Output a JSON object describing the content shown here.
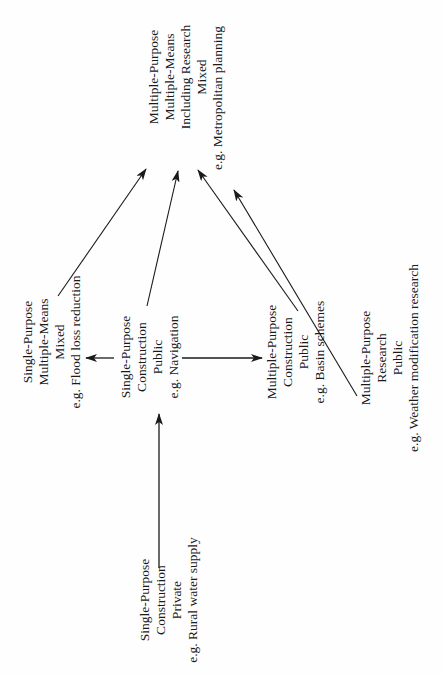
{
  "diagram": {
    "orientation": "rotated-90-ccw",
    "nodes": [
      {
        "id": "hub",
        "lines": [
          "Multiple-Purpose",
          "Multiple-Means",
          "Including Research",
          "Mixed",
          "e.g. Metropolitan planning"
        ]
      },
      {
        "id": "flood",
        "lines": [
          "Single-Purpose",
          "Multiple-Means",
          "Mixed",
          "e.g. Flood loss reduction"
        ]
      },
      {
        "id": "navigation",
        "lines": [
          "Single-Purpose",
          "Construction",
          "Public",
          "e.g. Navigation"
        ]
      },
      {
        "id": "basin",
        "lines": [
          "Multiple-Purpose",
          "Construction",
          "Public",
          "e.g. Basin schemes"
        ]
      },
      {
        "id": "weather",
        "lines": [
          "Multiple-Purpose",
          "Research",
          "Public",
          "e.g. Weather modification research"
        ]
      },
      {
        "id": "rural",
        "lines": [
          "Single-Purpose",
          "Construction",
          "Private",
          "e.g. Rural water supply"
        ]
      }
    ],
    "edges": [
      {
        "from": "rural",
        "to": "navigation"
      },
      {
        "from": "navigation",
        "to": "flood"
      },
      {
        "from": "navigation",
        "to": "basin"
      },
      {
        "from": "flood",
        "to": "hub"
      },
      {
        "from": "navigation",
        "to": "hub"
      },
      {
        "from": "basin",
        "to": "hub"
      },
      {
        "from": "weather",
        "to": "hub"
      }
    ],
    "colors": {
      "ink": "#1a1a1a",
      "paper": "#fefefe"
    }
  }
}
